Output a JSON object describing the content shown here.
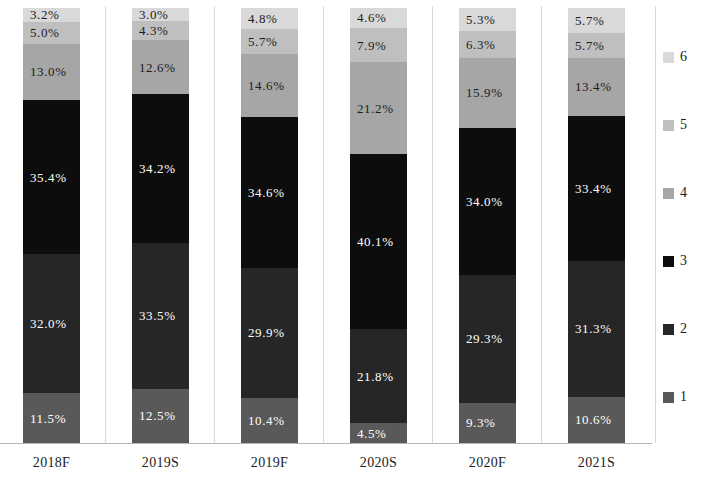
{
  "chart_data": {
    "type": "bar",
    "subtype": "stacked-percentage-column",
    "title": "",
    "subtitle": "",
    "xlabel": "",
    "ylabel": "",
    "ylim": [
      0,
      100
    ],
    "grid": false,
    "legend_position": "right",
    "categories": [
      "2018F",
      "2019S",
      "2019F",
      "2020S",
      "2020F",
      "2021S"
    ],
    "series": [
      {
        "name": "1",
        "color": "#595959",
        "values": [
          11.5,
          12.5,
          10.4,
          4.5,
          9.3,
          10.6
        ],
        "labels": [
          "11.5%",
          "12.5%",
          "10.4%",
          "4.5%",
          "9.3%",
          "10.6%"
        ]
      },
      {
        "name": "2",
        "color": "#262626",
        "values": [
          32.0,
          33.5,
          29.9,
          21.8,
          29.3,
          31.3
        ],
        "labels": [
          "32.0%",
          "33.5%",
          "29.9%",
          "21.8%",
          "29.3%",
          "31.3%"
        ]
      },
      {
        "name": "3",
        "color": "#0d0d0d",
        "values": [
          35.4,
          34.2,
          34.6,
          40.1,
          34.0,
          33.4
        ],
        "labels": [
          "35.4%",
          "34.2%",
          "34.6%",
          "40.1%",
          "34.0%",
          "33.4%"
        ]
      },
      {
        "name": "4",
        "color": "#a6a6a6",
        "values": [
          13.0,
          12.6,
          14.6,
          21.2,
          15.9,
          13.4
        ],
        "labels": [
          "13.0%",
          "12.6%",
          "14.6%",
          "21.2%",
          "15.9%",
          "13.4%"
        ]
      },
      {
        "name": "5",
        "color": "#bfbfbf",
        "values": [
          5.0,
          4.3,
          5.7,
          7.9,
          6.3,
          5.7
        ],
        "labels": [
          "5.0%",
          "4.3%",
          "5.7%",
          "7.9%",
          "6.3%",
          "5.7%"
        ]
      },
      {
        "name": "6",
        "color": "#d9d9d9",
        "values": [
          3.2,
          3.0,
          4.8,
          4.6,
          5.3,
          5.7
        ],
        "labels": [
          "3.2%",
          "3.0%",
          "4.8%",
          "4.6%",
          "5.3%",
          "5.7%"
        ]
      }
    ],
    "legend_entries": [
      {
        "label": "6",
        "color": "#d9d9d9"
      },
      {
        "label": "5",
        "color": "#bfbfbf"
      },
      {
        "label": "4",
        "color": "#a6a6a6"
      },
      {
        "label": "3",
        "color": "#0d0d0d"
      },
      {
        "label": "2",
        "color": "#262626"
      },
      {
        "label": "1",
        "color": "#595959"
      }
    ]
  },
  "axis": {
    "x_tick_labels": [
      "2018F",
      "2019S",
      "2019F",
      "2020S",
      "2020F",
      "2021S"
    ]
  },
  "legend": {
    "items": [
      {
        "label": "6"
      },
      {
        "label": "5"
      },
      {
        "label": "4"
      },
      {
        "label": "3"
      },
      {
        "label": "2"
      },
      {
        "label": "1"
      }
    ]
  }
}
